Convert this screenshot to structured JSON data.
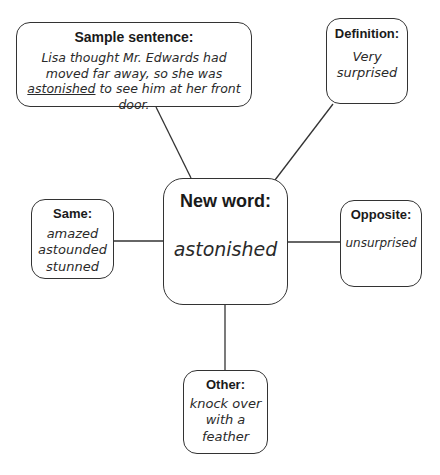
{
  "center": {
    "title": "New word:",
    "word": "astonished"
  },
  "sample_sentence": {
    "title": "Sample sentence:",
    "before": "Lisa thought Mr. Edwards had moved far away, so she was ",
    "underlined": "astonished",
    "after": " to see him at her front door."
  },
  "definition": {
    "title": "Definition:",
    "lines": [
      "Very",
      "surprised"
    ]
  },
  "same": {
    "title": "Same:",
    "lines": [
      "amazed",
      "astounded",
      "stunned"
    ]
  },
  "opposite": {
    "title": "Opposite:",
    "lines": [
      "unsurprised"
    ]
  },
  "other": {
    "title": "Other:",
    "lines": [
      "knock over",
      "with a",
      "feather"
    ]
  }
}
